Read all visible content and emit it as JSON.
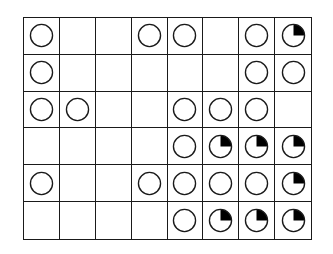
{
  "diagram": {
    "type": "grid-of-circles",
    "rows": 6,
    "cols": 8,
    "legend": {
      "o": "open-circle",
      "q": "circle-with-filled-top-right-quarter",
      "_": "empty"
    },
    "colors": {
      "line": "#1a1a1a",
      "fill": "#000000",
      "background": "#ffffff"
    },
    "cells": [
      [
        "o",
        "_",
        "_",
        "o",
        "o",
        "_",
        "o",
        "q"
      ],
      [
        "o",
        "_",
        "_",
        "_",
        "_",
        "_",
        "o",
        "o"
      ],
      [
        "o",
        "o",
        "_",
        "_",
        "o",
        "o",
        "o",
        "_"
      ],
      [
        "_",
        "_",
        "_",
        "_",
        "o",
        "q",
        "q",
        "q"
      ],
      [
        "o",
        "_",
        "_",
        "o",
        "o",
        "o",
        "o",
        "q"
      ],
      [
        "_",
        "_",
        "_",
        "_",
        "o",
        "q",
        "q",
        "q"
      ]
    ]
  }
}
